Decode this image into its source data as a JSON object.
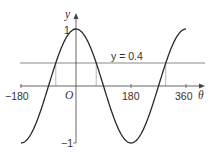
{
  "figure": {
    "axes": {
      "x_label": "θ",
      "y_label": "y",
      "origin_label": "O",
      "x_ticks": [
        "−180",
        "180",
        "360"
      ],
      "y_ticks": [
        "1",
        "−1"
      ]
    },
    "curve": {
      "function": "y = cos θ",
      "domain": [
        -180,
        360
      ]
    },
    "line": {
      "label": "y = 0.4",
      "value": 0.4
    },
    "intersections_theta": [
      -66.4,
      66.4,
      293.6
    ],
    "colors": {
      "curve": "#2a2a2a",
      "axes": "#555555",
      "line": "#8a8a8a"
    }
  }
}
